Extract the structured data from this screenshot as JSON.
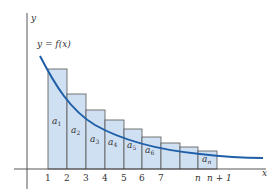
{
  "figure": {
    "y_axis_label": "y",
    "x_axis_label": "x",
    "function_label": "y = f(x)",
    "colors": {
      "curve": "#1f5fa8",
      "rect_fill": "#cfe0f2",
      "rect_stroke": "#555555",
      "axis": "#444444",
      "text": "#333333"
    },
    "ticks": [
      "1",
      "2",
      "3",
      "4",
      "5",
      "6",
      "7",
      "n",
      "n + 1"
    ],
    "rectangles": [
      {
        "label_base": "a",
        "label_sub": "1"
      },
      {
        "label_base": "a",
        "label_sub": "2"
      },
      {
        "label_base": "a",
        "label_sub": "3"
      },
      {
        "label_base": "a",
        "label_sub": "4"
      },
      {
        "label_base": "a",
        "label_sub": "5"
      },
      {
        "label_base": "a",
        "label_sub": "6"
      },
      {
        "label_base": "",
        "label_sub": ""
      },
      {
        "label_base": "",
        "label_sub": ""
      },
      {
        "label_base": "a",
        "label_sub": "n"
      }
    ]
  }
}
